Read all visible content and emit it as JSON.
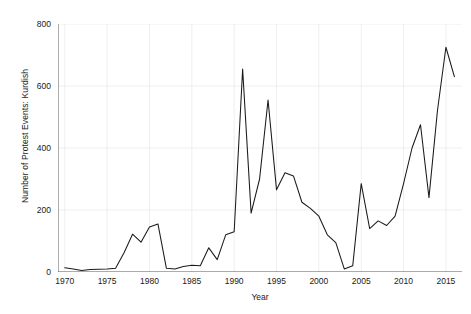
{
  "chart_data": {
    "type": "line",
    "title": "",
    "xlabel": "Year",
    "ylabel": "Number of Protest Events: Kurdish",
    "xlim": [
      1969.2,
      1916.0
    ],
    "x_range": [
      1969.2,
      2016.8
    ],
    "ylim": [
      0,
      800
    ],
    "xticks": [
      1970,
      1975,
      1980,
      1985,
      1990,
      1995,
      2000,
      2005,
      2010,
      2015
    ],
    "yticks": [
      0,
      200,
      400,
      600,
      800
    ],
    "grid": true,
    "grid_color": "#e8e8e8",
    "line_color": "#1a1a1a",
    "legend": null,
    "x": [
      1970,
      1971,
      1972,
      1973,
      1974,
      1975,
      1976,
      1977,
      1978,
      1979,
      1980,
      1981,
      1982,
      1983,
      1984,
      1985,
      1986,
      1987,
      1988,
      1989,
      1990,
      1991,
      1992,
      1993,
      1994,
      1995,
      1996,
      1997,
      1998,
      1999,
      2000,
      2001,
      2002,
      2003,
      2004,
      2005,
      2006,
      2007,
      2008,
      2009,
      2010,
      2011,
      2012,
      2013,
      2014,
      2015,
      2016
    ],
    "values": [
      14,
      10,
      5,
      8,
      9,
      10,
      12,
      62,
      122,
      96,
      145,
      155,
      12,
      10,
      18,
      22,
      20,
      78,
      40,
      120,
      130,
      655,
      190,
      300,
      555,
      265,
      320,
      310,
      225,
      205,
      180,
      120,
      95,
      10,
      20,
      285,
      140,
      165,
      150,
      180,
      285,
      400,
      475,
      240,
      520,
      725,
      630
    ],
    "series": [
      {
        "name": "Number of Protest Events: Kurdish",
        "values": [
          14,
          10,
          5,
          8,
          9,
          10,
          12,
          62,
          122,
          96,
          145,
          155,
          12,
          10,
          18,
          22,
          20,
          78,
          40,
          120,
          130,
          655,
          190,
          300,
          555,
          265,
          320,
          310,
          225,
          205,
          180,
          120,
          95,
          10,
          20,
          285,
          140,
          165,
          150,
          180,
          285,
          400,
          475,
          240,
          520,
          725,
          630
        ]
      }
    ]
  }
}
